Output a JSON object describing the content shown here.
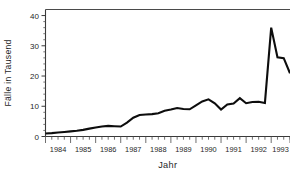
{
  "chart_data": {
    "type": "line",
    "title": "",
    "xlabel": "Jahr",
    "ylabel": "Fälle in Tausend",
    "ylim": [
      0,
      42
    ],
    "xlim": [
      1984.0,
      1993.75
    ],
    "ytick_labels": [
      "0",
      "10",
      "20",
      "30",
      "40"
    ],
    "ytick_values": [
      0,
      10,
      20,
      30,
      40
    ],
    "yminor_step": 2,
    "xtick_labels": [
      "1984",
      "1985",
      "1986",
      "1987",
      "1988",
      "1989",
      "1990",
      "1991",
      "1992",
      "1993"
    ],
    "xtick_values": [
      1984,
      1985,
      1986,
      1987,
      1988,
      1989,
      1990,
      1991,
      1992,
      1993
    ],
    "x_minor_per_year": 4,
    "grid": false,
    "legend": false,
    "legend_position": "none",
    "line_color": "#0d0d0d",
    "axis_color": "#3a3a3a",
    "background": "#ffffff",
    "series": [
      {
        "name": "Fälle",
        "x": [
          1984.0,
          1984.25,
          1984.5,
          1984.75,
          1985.0,
          1985.25,
          1985.5,
          1985.75,
          1986.0,
          1986.25,
          1986.5,
          1986.75,
          1987.0,
          1987.25,
          1987.5,
          1987.75,
          1988.0,
          1988.25,
          1988.5,
          1988.75,
          1989.0,
          1989.25,
          1989.5,
          1989.75,
          1990.0,
          1990.25,
          1990.5,
          1990.75,
          1991.0,
          1991.25,
          1991.5,
          1991.75,
          1992.0,
          1992.25,
          1992.5,
          1992.75,
          1993.0,
          1993.25,
          1993.5,
          1993.75
        ],
        "values": [
          1.0,
          1.1,
          1.3,
          1.5,
          1.7,
          1.9,
          2.2,
          2.6,
          3.0,
          3.3,
          3.5,
          3.4,
          3.3,
          4.6,
          6.2,
          7.1,
          7.3,
          7.4,
          7.7,
          8.5,
          8.9,
          9.4,
          9.1,
          9.0,
          10.3,
          11.6,
          12.3,
          11.0,
          8.9,
          10.6,
          10.9,
          12.7,
          11.0,
          11.4,
          11.5,
          11.1,
          36.0,
          26.2,
          25.9,
          20.9
        ]
      }
    ],
    "annotations": [
      {
        "text": "Starker Anstieg 1993",
        "x": 1993.0,
        "y": 36.0,
        "visible": false
      }
    ]
  },
  "axis": {
    "y_title": "Fälle in Tausend",
    "x_title": "Jahr"
  },
  "cropped_header": {
    "note": "partial descenders of a cut-off caption line",
    "glyphs": [
      "g",
      "g",
      "g"
    ]
  }
}
